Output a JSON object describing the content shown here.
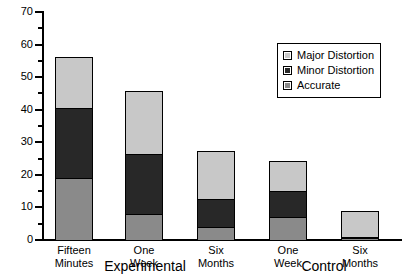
{
  "chart_data": {
    "type": "bar",
    "subtype": "stacked",
    "title": "",
    "xlabel": "",
    "ylabel": "",
    "ylim": [
      0,
      70
    ],
    "yticks": [
      0,
      10,
      20,
      30,
      40,
      50,
      60,
      70
    ],
    "ytick_labels": [
      "0",
      "10",
      "20",
      "30",
      "40",
      "50",
      "60",
      "70"
    ],
    "grid": false,
    "legend_position": "upper right",
    "categories": [
      "Fifteen Minutes",
      "One Week",
      "Six Months",
      "One Week",
      "Six Months"
    ],
    "groups": [
      {
        "name": "Experimental",
        "categories": [
          "Fifteen Minutes",
          "One Week",
          "Six Months"
        ]
      },
      {
        "name": "Control",
        "categories": [
          "One Week",
          "Six Months"
        ]
      }
    ],
    "series": [
      {
        "name": "Accurate",
        "color": "#8a8a8a",
        "values": [
          19,
          8,
          4,
          7,
          0.5
        ]
      },
      {
        "name": "Minor Distortion",
        "color": "#282828",
        "values": [
          21.5,
          18.5,
          8.5,
          8,
          0.5
        ]
      },
      {
        "name": "Major Distortion",
        "color": "#c8c8c8",
        "values": [
          15.5,
          19,
          14.5,
          9,
          7.5
        ]
      }
    ],
    "totals": [
      56,
      45.5,
      27,
      24,
      8.5
    ]
  },
  "axis": {
    "y_labels": [
      "70",
      "60",
      "50",
      "40",
      "30",
      "20",
      "10",
      "0"
    ]
  },
  "legend": {
    "items": [
      {
        "label": "Major Distortion",
        "color": "#c8c8c8"
      },
      {
        "label": "Minor Distortion",
        "color": "#282828"
      },
      {
        "label": "Accurate",
        "color": "#8a8a8a"
      }
    ]
  },
  "x_axis": {
    "ticks": [
      {
        "line1": "Fifteen",
        "line2": "Minutes"
      },
      {
        "line1": "One",
        "line2": "Week"
      },
      {
        "line1": "Six",
        "line2": "Months"
      },
      {
        "line1": "One",
        "line2": "Week"
      },
      {
        "line1": "Six",
        "line2": "Months"
      }
    ],
    "groups": [
      "Experimental",
      "Control"
    ]
  }
}
